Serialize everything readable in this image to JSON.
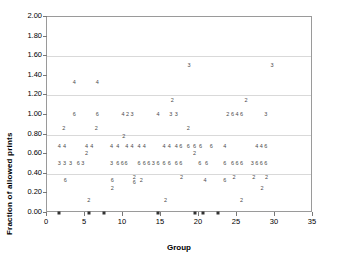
{
  "chart_data": {
    "type": "scatter",
    "title": "",
    "xlabel": "Group",
    "ylabel": "Fraction of allowed prints",
    "xlim": [
      0,
      35
    ],
    "ylim": [
      0,
      2.0
    ],
    "xticks": [
      "0",
      "5",
      "10",
      "15",
      "20",
      "25",
      "30",
      "35"
    ],
    "xtick_values": [
      0,
      5,
      10,
      15,
      20,
      25,
      30,
      35
    ],
    "yticks": [
      "0.00",
      "0.20",
      "0.40",
      "0.60",
      "0.80",
      "1.00",
      "1.20",
      "1.40",
      "1.60",
      "1.80",
      "2.00"
    ],
    "ytick_values": [
      0.0,
      0.2,
      0.4,
      0.6,
      0.8,
      1.0,
      1.2,
      1.4,
      1.6,
      1.8,
      2.0
    ],
    "gridlines": [
      0.4,
      0.8,
      1.2,
      1.6
    ],
    "grid": true,
    "legend": "none",
    "marker_style": "numeric-label",
    "note": "Each plotted point is rendered as a small digit indicating its count/denominator.",
    "points": [
      {
        "x": 1.6,
        "y": 0.67,
        "label": "4"
      },
      {
        "x": 2.3,
        "y": 0.67,
        "label": "4"
      },
      {
        "x": 1.6,
        "y": 0.5,
        "label": "3"
      },
      {
        "x": 2.3,
        "y": 0.5,
        "label": "3"
      },
      {
        "x": 2.2,
        "y": 0.86,
        "label": "2"
      },
      {
        "x": 2.4,
        "y": 0.33,
        "label": "6"
      },
      {
        "x": 1.6,
        "y": 0.0,
        "label": "zero"
      },
      {
        "x": 3.1,
        "y": 0.5,
        "label": "3"
      },
      {
        "x": 3.6,
        "y": 1.33,
        "label": "4"
      },
      {
        "x": 3.6,
        "y": 1.0,
        "label": "6"
      },
      {
        "x": 4.1,
        "y": 0.5,
        "label": "6"
      },
      {
        "x": 4.7,
        "y": 0.5,
        "label": "3"
      },
      {
        "x": 5.2,
        "y": 0.67,
        "label": "4"
      },
      {
        "x": 5.2,
        "y": 0.6,
        "label": "2"
      },
      {
        "x": 5.9,
        "y": 0.67,
        "label": "4"
      },
      {
        "x": 5.5,
        "y": 0.12,
        "label": "2"
      },
      {
        "x": 5.5,
        "y": 0.0,
        "label": "zero"
      },
      {
        "x": 6.6,
        "y": 1.33,
        "label": "4"
      },
      {
        "x": 6.6,
        "y": 1.0,
        "label": "6"
      },
      {
        "x": 6.5,
        "y": 0.86,
        "label": "2"
      },
      {
        "x": 7.5,
        "y": 0.0,
        "label": "zero"
      },
      {
        "x": 8.5,
        "y": 0.67,
        "label": "4"
      },
      {
        "x": 8.5,
        "y": 0.5,
        "label": "3"
      },
      {
        "x": 8.6,
        "y": 0.33,
        "label": "6"
      },
      {
        "x": 8.6,
        "y": 0.24,
        "label": "2"
      },
      {
        "x": 9.3,
        "y": 0.67,
        "label": "4"
      },
      {
        "x": 9.3,
        "y": 0.5,
        "label": "6"
      },
      {
        "x": 9.9,
        "y": 0.5,
        "label": "6"
      },
      {
        "x": 10.0,
        "y": 1.0,
        "label": "4"
      },
      {
        "x": 10.1,
        "y": 0.78,
        "label": "2"
      },
      {
        "x": 10.6,
        "y": 1.0,
        "label": "2"
      },
      {
        "x": 10.5,
        "y": 0.67,
        "label": "4"
      },
      {
        "x": 10.4,
        "y": 0.5,
        "label": "6"
      },
      {
        "x": 11.2,
        "y": 1.0,
        "label": "3"
      },
      {
        "x": 11.2,
        "y": 0.67,
        "label": "4"
      },
      {
        "x": 11.5,
        "y": 0.36,
        "label": "2"
      },
      {
        "x": 11.5,
        "y": 0.31,
        "label": "6"
      },
      {
        "x": 12.1,
        "y": 0.67,
        "label": "4"
      },
      {
        "x": 12.1,
        "y": 0.5,
        "label": "6"
      },
      {
        "x": 12.4,
        "y": 0.33,
        "label": "2"
      },
      {
        "x": 12.8,
        "y": 0.67,
        "label": "4"
      },
      {
        "x": 12.8,
        "y": 0.5,
        "label": "6"
      },
      {
        "x": 13.4,
        "y": 0.5,
        "label": "6"
      },
      {
        "x": 14.0,
        "y": 0.5,
        "label": "3"
      },
      {
        "x": 14.6,
        "y": 0.5,
        "label": "6"
      },
      {
        "x": 14.6,
        "y": 1.0,
        "label": "4"
      },
      {
        "x": 14.6,
        "y": 0.0,
        "label": "zero"
      },
      {
        "x": 15.4,
        "y": 0.67,
        "label": "4"
      },
      {
        "x": 15.4,
        "y": 0.5,
        "label": "6"
      },
      {
        "x": 15.6,
        "y": 0.12,
        "label": "2"
      },
      {
        "x": 16.1,
        "y": 0.67,
        "label": "4"
      },
      {
        "x": 16.1,
        "y": 0.5,
        "label": "6"
      },
      {
        "x": 16.3,
        "y": 1.0,
        "label": "3"
      },
      {
        "x": 16.5,
        "y": 1.14,
        "label": "2"
      },
      {
        "x": 17.0,
        "y": 1.0,
        "label": "3"
      },
      {
        "x": 17.0,
        "y": 0.67,
        "label": "4"
      },
      {
        "x": 17.0,
        "y": 0.5,
        "label": "6"
      },
      {
        "x": 17.6,
        "y": 0.67,
        "label": "6"
      },
      {
        "x": 17.6,
        "y": 0.5,
        "label": "6"
      },
      {
        "x": 17.7,
        "y": 0.36,
        "label": "2"
      },
      {
        "x": 18.7,
        "y": 1.5,
        "label": "3"
      },
      {
        "x": 18.6,
        "y": 0.86,
        "label": "2"
      },
      {
        "x": 18.6,
        "y": 0.67,
        "label": "6"
      },
      {
        "x": 19.4,
        "y": 0.67,
        "label": "6"
      },
      {
        "x": 19.4,
        "y": 0.6,
        "label": "2"
      },
      {
        "x": 19.5,
        "y": 0.0,
        "label": "zero"
      },
      {
        "x": 20.2,
        "y": 0.67,
        "label": "6"
      },
      {
        "x": 20.1,
        "y": 0.5,
        "label": "6"
      },
      {
        "x": 20.5,
        "y": 0.0,
        "label": "zero"
      },
      {
        "x": 20.8,
        "y": 0.33,
        "label": "4"
      },
      {
        "x": 21.0,
        "y": 0.5,
        "label": "6"
      },
      {
        "x": 21.6,
        "y": 0.67,
        "label": "6"
      },
      {
        "x": 22.5,
        "y": 0.0,
        "label": "zero"
      },
      {
        "x": 23.4,
        "y": 0.67,
        "label": "4"
      },
      {
        "x": 23.4,
        "y": 0.5,
        "label": "6"
      },
      {
        "x": 23.4,
        "y": 0.33,
        "label": "6"
      },
      {
        "x": 23.8,
        "y": 1.0,
        "label": "2"
      },
      {
        "x": 24.4,
        "y": 1.0,
        "label": "6"
      },
      {
        "x": 24.4,
        "y": 0.5,
        "label": "6"
      },
      {
        "x": 24.6,
        "y": 0.36,
        "label": "2"
      },
      {
        "x": 25.0,
        "y": 1.0,
        "label": "4"
      },
      {
        "x": 25.0,
        "y": 0.5,
        "label": "6"
      },
      {
        "x": 25.6,
        "y": 1.0,
        "label": "6"
      },
      {
        "x": 25.6,
        "y": 0.5,
        "label": "6"
      },
      {
        "x": 25.6,
        "y": 0.12,
        "label": "2"
      },
      {
        "x": 26.2,
        "y": 1.14,
        "label": "2"
      },
      {
        "x": 27.0,
        "y": 0.5,
        "label": "3"
      },
      {
        "x": 27.2,
        "y": 0.36,
        "label": "2"
      },
      {
        "x": 27.6,
        "y": 0.67,
        "label": "4"
      },
      {
        "x": 27.6,
        "y": 0.5,
        "label": "6"
      },
      {
        "x": 28.2,
        "y": 0.67,
        "label": "4"
      },
      {
        "x": 28.2,
        "y": 0.5,
        "label": "6"
      },
      {
        "x": 28.3,
        "y": 0.24,
        "label": "2"
      },
      {
        "x": 28.8,
        "y": 1.0,
        "label": "3"
      },
      {
        "x": 28.8,
        "y": 0.67,
        "label": "6"
      },
      {
        "x": 28.8,
        "y": 0.5,
        "label": "6"
      },
      {
        "x": 28.9,
        "y": 0.36,
        "label": "2"
      },
      {
        "x": 29.6,
        "y": 1.5,
        "label": "3"
      }
    ]
  }
}
